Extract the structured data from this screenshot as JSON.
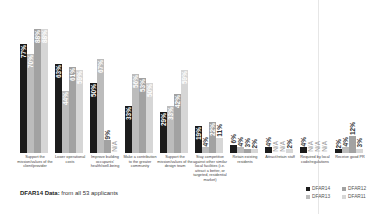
{
  "colors": {
    "DFAR14": "#1c1c1c",
    "DFAR13": "#bcbcbc",
    "DFAR12": "#a2a2a2",
    "DFAR11": "#d6d6d6"
  },
  "footer": {
    "label": "DFAR14 Data:",
    "text": " from all 53 applicants"
  },
  "legend": [
    {
      "name": "DFAR14",
      "key": "DFAR14"
    },
    {
      "name": "DFAR12",
      "key": "DFAR12"
    },
    {
      "name": "DFAR13",
      "key": "DFAR13"
    },
    {
      "name": "DFAR11",
      "key": "DFAR11"
    }
  ],
  "chart_data": {
    "type": "bar",
    "title": "",
    "xlabel": "",
    "ylabel": "",
    "ylim": [
      0,
      100
    ],
    "grid": false,
    "legend_position": "bottom-right",
    "bar_order": [
      "DFAR14",
      "DFAR13",
      "DFAR12",
      "DFAR11"
    ],
    "categories": [
      "Support the mission/values of the client/provider",
      "Lower operational costs",
      "Improve building occupants' health/well-being",
      "Make a contribution to the greater community",
      "Support the mission/values of the design team",
      "Stay competitive against other similar local facilities (i.e. attract a better, or targeted, residential market)",
      "Retain existing residents",
      "Attract/retain staff",
      "Required by local code/regulations",
      "Receive good PR"
    ],
    "series": [
      {
        "name": "DFAR14",
        "values": [
          77,
          63,
          50,
          33,
          29,
          19,
          6,
          4,
          4,
          2
        ],
        "labels": [
          "77%",
          "63%",
          "50%",
          "33%",
          "29%",
          "19%",
          "6%",
          "4%",
          "4%",
          "2%"
        ]
      },
      {
        "name": "DFAR13",
        "values": [
          70,
          44,
          67,
          56,
          33,
          4,
          4,
          null,
          null,
          4
        ],
        "labels": [
          "70%",
          "44%",
          "67%",
          "56%",
          "33%",
          "4%",
          "4%",
          "N/A",
          "N/A",
          "4%"
        ]
      },
      {
        "name": "DFAR12",
        "values": [
          88,
          61,
          9,
          53,
          42,
          22,
          3,
          null,
          null,
          12
        ],
        "labels": [
          "88%",
          "61%",
          "9%",
          "53%",
          "42%",
          "22%",
          "3%",
          "N/A",
          "N/A",
          "12%"
        ]
      },
      {
        "name": "DFAR11",
        "values": [
          88,
          59,
          null,
          50,
          59,
          11,
          2,
          2,
          null,
          3
        ],
        "labels": [
          "88%",
          "59%",
          "N/A",
          "50%",
          "59%",
          "11%",
          "2%",
          "2%",
          "N/A",
          "3%"
        ]
      }
    ]
  }
}
